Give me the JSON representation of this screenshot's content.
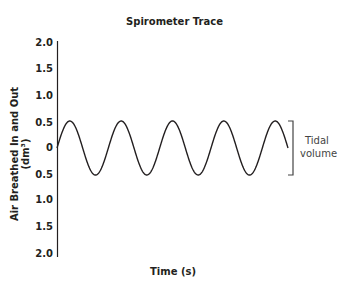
{
  "chart_data": {
    "type": "line",
    "title": "Spirometer Trace",
    "xlabel": "Time (s)",
    "ylabel": "Air Breathed In and Out (dm³)",
    "y_tick_labels": [
      "2.0",
      "1.5",
      "1.0",
      "0.5",
      "0",
      "0.5",
      "1.0",
      "1.5",
      "2.0"
    ],
    "ylim": [
      -2.0,
      2.0
    ],
    "x_ticks": [],
    "grid": false,
    "series": [
      {
        "name": "Spirometer trace",
        "shape": "sine",
        "amplitude": 0.5,
        "cycles": 4.5,
        "start_value": 0,
        "end_value": 0,
        "peaks": 5,
        "troughs": 4
      }
    ],
    "annotations": [
      {
        "text": "Tidal volume",
        "type": "bracket",
        "from": 0.5,
        "to": -0.5
      }
    ]
  },
  "labels": {
    "title": "Spirometer Trace",
    "xlabel": "Time (s)",
    "ylabel": "Air Breathed In and Out (dm³)",
    "annotation_line1": "Tidal",
    "annotation_line2": "volume",
    "ticks": [
      "2.0",
      "1.5",
      "1.0",
      "0.5",
      "0",
      "0.5",
      "1.0",
      "1.5",
      "2.0"
    ]
  },
  "colors": {
    "line": "#231f20",
    "bracket": "#444444",
    "background": "#ffffff"
  }
}
